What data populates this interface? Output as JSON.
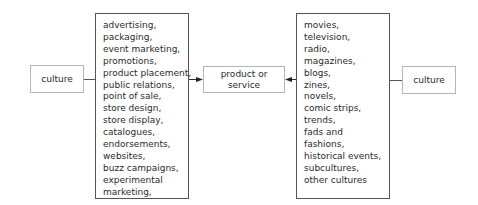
{
  "diagram": {
    "left_culture": {
      "label": "culture"
    },
    "left_list": {
      "items": [
        "advertising,",
        "packaging,",
        "event marketing,",
        "promotions,",
        "product placement,",
        "public relations,",
        "point of sale,",
        "store design,",
        "store display,",
        "catalogues,",
        "endorsements,",
        "websites,",
        "buzz campaigns,",
        "experimental",
        "marketing,"
      ]
    },
    "center": {
      "line1": "product or",
      "line2": "service"
    },
    "right_list": {
      "items": [
        "movies,",
        "television,",
        "radio,",
        "magazines,",
        "blogs,",
        "zines,",
        "novels,",
        "comic strips,",
        "trends,",
        "fads and",
        "fashions,",
        "historical events,",
        "subcultures,",
        "other cultures"
      ]
    },
    "right_culture": {
      "label": "culture"
    },
    "colors": {
      "box_border_light": "#b5b5b5",
      "box_border_dark": "#555555",
      "text": "#2a2a2a"
    }
  }
}
